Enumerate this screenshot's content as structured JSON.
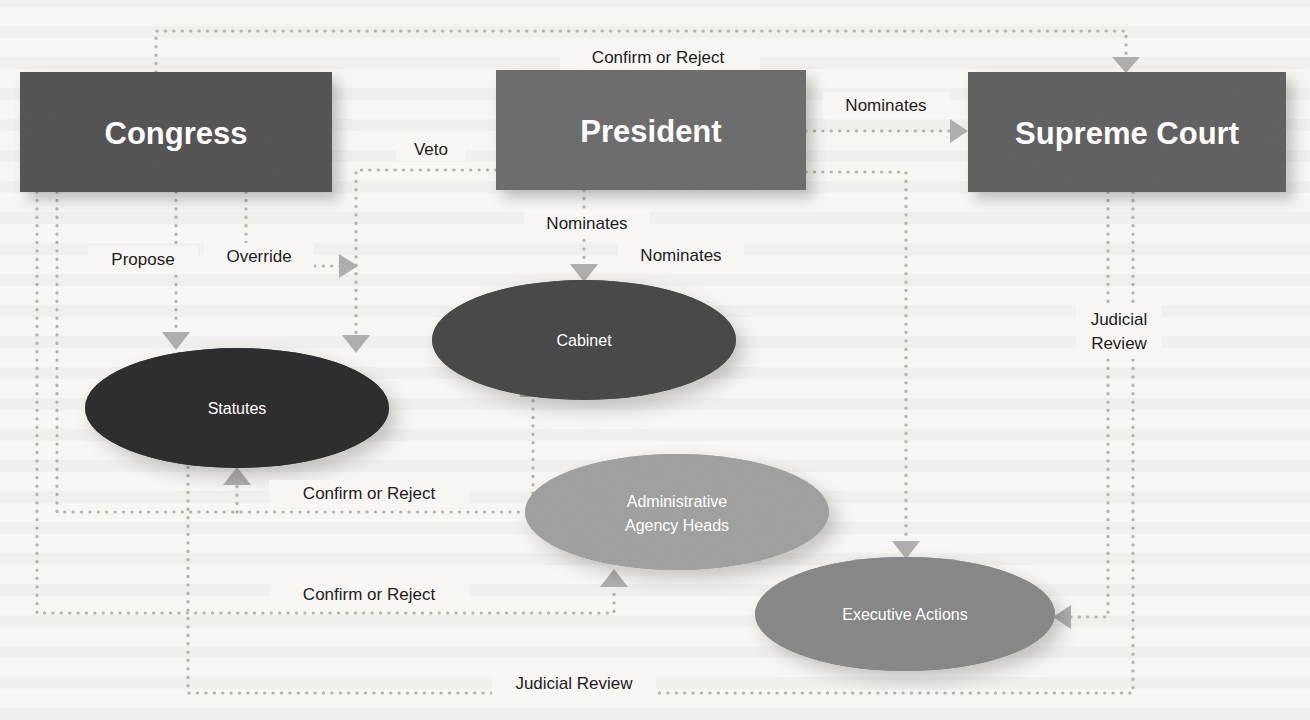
{
  "diagram": {
    "nodes": [
      {
        "id": "congress",
        "label": "Congress",
        "shape": "rect",
        "color": "#565656",
        "x": 20,
        "y": 72,
        "w": 312,
        "h": 120,
        "font_size": 31
      },
      {
        "id": "president",
        "label": "President",
        "shape": "rect",
        "color": "#6f6f6f",
        "x": 496,
        "y": 70,
        "w": 310,
        "h": 120,
        "font_size": 31
      },
      {
        "id": "supreme",
        "label": "Supreme Court",
        "shape": "rect",
        "color": "#636363",
        "x": 968,
        "y": 72,
        "w": 318,
        "h": 120,
        "font_size": 31
      },
      {
        "id": "statutes",
        "label": "Statutes",
        "shape": "ellipse",
        "color": "#2e2e2e",
        "cx": 237,
        "cy": 408,
        "rx": 152,
        "ry": 60,
        "font_size": 16
      },
      {
        "id": "cabinet",
        "label": "Cabinet",
        "shape": "ellipse",
        "color": "#4a4a4a",
        "cx": 584,
        "cy": 340,
        "rx": 152,
        "ry": 60,
        "font_size": 16
      },
      {
        "id": "agencies",
        "label": "Administrative\nAgency Heads",
        "shape": "ellipse",
        "color": "#a3a3a3",
        "cx": 677,
        "cy": 512,
        "rx": 152,
        "ry": 58,
        "font_size": 16
      },
      {
        "id": "execactions",
        "label": "Executive Actions",
        "shape": "ellipse",
        "color": "#8a8a8a",
        "cx": 905,
        "cy": 614,
        "rx": 150,
        "ry": 57,
        "font_size": 16
      }
    ],
    "edges": [
      {
        "id": "congress-confirm-supreme",
        "label": "Confirm or Reject",
        "from": "congress",
        "to": "supreme",
        "label_x": 658,
        "label_y": 60
      },
      {
        "id": "president-nominates-supreme",
        "label": "Nominates",
        "from": "president",
        "to": "supreme",
        "label_x": 885,
        "label_y": 108
      },
      {
        "id": "congress-propose-statutes",
        "label": "Propose",
        "from": "congress",
        "to": "statutes",
        "label_x": 142,
        "label_y": 262
      },
      {
        "id": "congress-override-statutes",
        "label": "Override",
        "from": "congress",
        "to": "statutes",
        "label_x": 257,
        "label_y": 259
      },
      {
        "id": "president-veto-statutes",
        "label": "Veto",
        "from": "president",
        "to": "statutes",
        "label_x": 430,
        "label_y": 152
      },
      {
        "id": "president-nominates-cabinet",
        "label": "Nominates",
        "from": "president",
        "to": "cabinet",
        "label_x": 586,
        "label_y": 226
      },
      {
        "id": "president-nominates-agency",
        "label": "Nominates",
        "from": "president",
        "to": "agencies",
        "label_x": 680,
        "label_y": 258
      },
      {
        "id": "congress-confirm-cabinet",
        "label": "Confirm or Reject",
        "from": "congress",
        "to": "cabinet",
        "label_x": 367,
        "label_y": 496
      },
      {
        "id": "congress-confirm-agency",
        "label": "Confirm or Reject",
        "from": "congress",
        "to": "agencies",
        "label_x": 367,
        "label_y": 597
      },
      {
        "id": "supreme-review-execactions",
        "label": "Judicial\nReview",
        "from": "supreme",
        "to": "execactions",
        "label_x": 1117,
        "label_y": 330
      },
      {
        "id": "supreme-review-statutes",
        "label": "Judicial Review",
        "from": "supreme",
        "to": "statutes",
        "label_x": 568,
        "label_y": 685
      }
    ],
    "colors": {
      "background": "#f7f6f3",
      "connector": "#b4b2ad",
      "arrow": "#b0aeaa",
      "label_text": "#1c1c1c",
      "node_text": "#ffffff"
    }
  }
}
